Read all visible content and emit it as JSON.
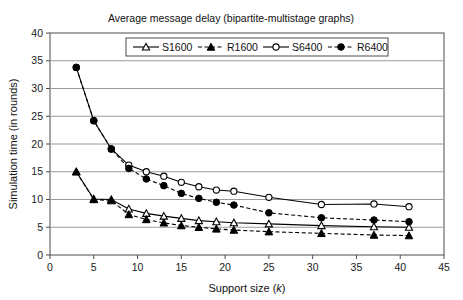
{
  "chart_data": {
    "type": "line",
    "title": "Average message delay (bipartite-multistage graphs)",
    "xlabel": "Support size (k)",
    "xlabel_plain": "Support size (",
    "xlabel_italic": "k",
    "xlabel_tail": ")",
    "ylabel": "Simulation time (in rounds)",
    "xlim": [
      0,
      45
    ],
    "ylim": [
      0,
      40
    ],
    "xticks": [
      0,
      5,
      10,
      15,
      20,
      25,
      30,
      35,
      40,
      45
    ],
    "yticks": [
      0,
      5,
      10,
      15,
      20,
      25,
      30,
      35,
      40
    ],
    "grid": "horizontal",
    "legend_position": "top-inside",
    "series": [
      {
        "name": "S1600",
        "line": "solid",
        "marker": "open-triangle",
        "color": "#000000",
        "x": [
          3,
          5,
          7,
          9,
          11,
          13,
          15,
          17,
          19,
          21,
          25,
          31,
          37,
          41
        ],
        "y": [
          15.0,
          10.1,
          10.0,
          8.3,
          7.5,
          7.0,
          6.6,
          6.2,
          6.0,
          5.8,
          5.6,
          5.3,
          5.1,
          5.0
        ]
      },
      {
        "name": "R1600",
        "line": "dashed",
        "marker": "filled-triangle",
        "color": "#000000",
        "x": [
          3,
          5,
          7,
          9,
          11,
          13,
          15,
          17,
          19,
          21,
          25,
          31,
          37,
          41
        ],
        "y": [
          15.0,
          10.0,
          9.8,
          7.3,
          6.4,
          5.8,
          5.3,
          5.0,
          4.7,
          4.5,
          4.2,
          3.9,
          3.6,
          3.5
        ]
      },
      {
        "name": "S6400",
        "line": "solid",
        "marker": "open-circle",
        "color": "#000000",
        "x": [
          3,
          5,
          7,
          9,
          11,
          13,
          15,
          17,
          19,
          21,
          25,
          31,
          37,
          41
        ],
        "y": [
          33.8,
          24.2,
          19.1,
          16.2,
          15.0,
          14.2,
          13.1,
          12.3,
          11.7,
          11.5,
          10.4,
          9.1,
          9.2,
          8.7
        ]
      },
      {
        "name": "R6400",
        "line": "dashed",
        "marker": "filled-circle",
        "color": "#000000",
        "x": [
          3,
          5,
          7,
          9,
          11,
          13,
          15,
          17,
          19,
          21,
          25,
          31,
          37,
          41
        ],
        "y": [
          33.8,
          24.2,
          19.1,
          15.6,
          13.7,
          12.5,
          11.1,
          10.2,
          9.5,
          9.0,
          7.6,
          6.7,
          6.3,
          6.0
        ]
      }
    ]
  },
  "legend": {
    "items": [
      {
        "label": "S1600"
      },
      {
        "label": "R1600"
      },
      {
        "label": "S6400"
      },
      {
        "label": "R6400"
      }
    ]
  }
}
